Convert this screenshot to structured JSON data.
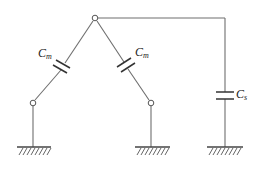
{
  "diagram": {
    "type": "capacitance circuit schematic",
    "capacitors": [
      {
        "id": "left",
        "label": "C",
        "subscript": "m"
      },
      {
        "id": "middle",
        "label": "C",
        "subscript": "m"
      },
      {
        "id": "right",
        "label": "C",
        "subscript": "s"
      }
    ],
    "nodes": [
      "top-node",
      "left-lower-node",
      "middle-lower-node"
    ],
    "grounds": 3,
    "colors": {
      "wire": "#6e6e6e",
      "plate": "#333333",
      "background": "#ffffff"
    }
  }
}
